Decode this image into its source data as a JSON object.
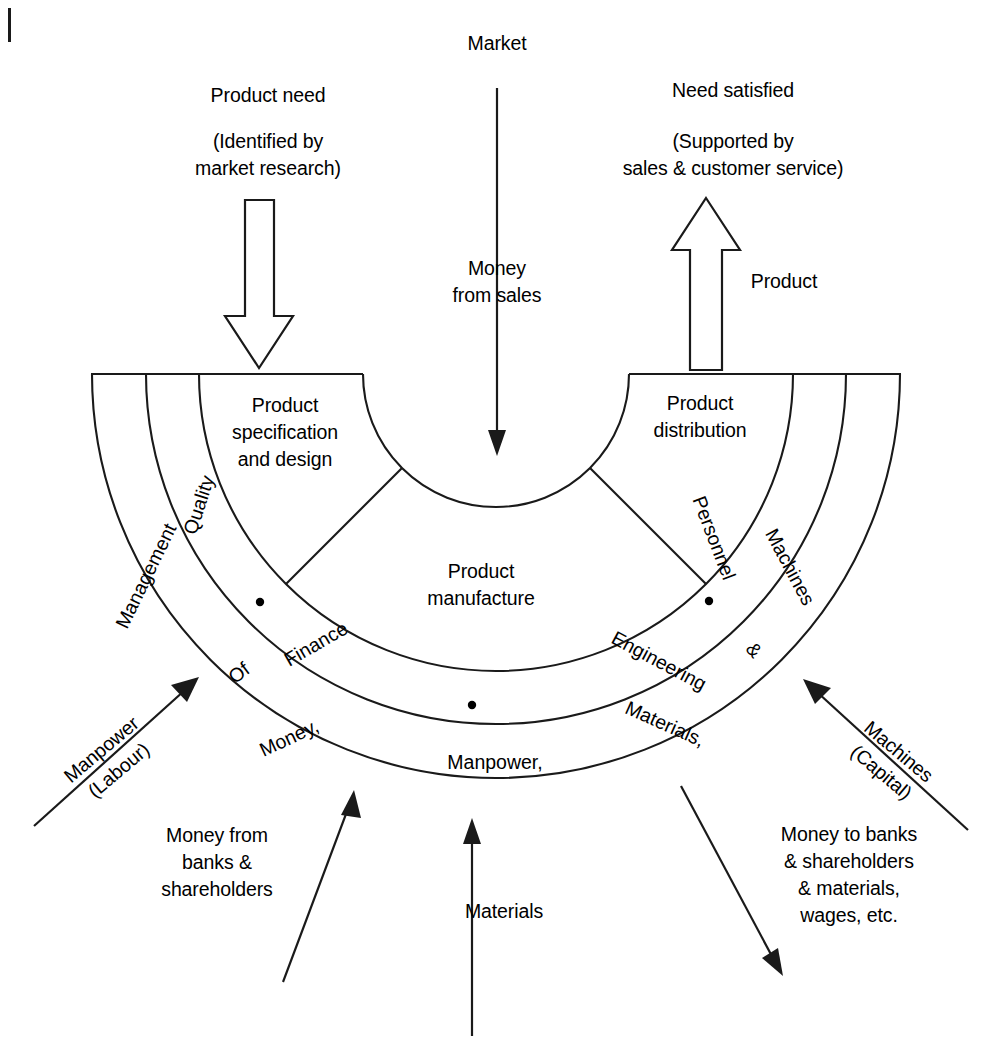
{
  "diagram": {
    "title_top": "Market",
    "flows": {
      "product_need": "Product need",
      "product_need_sub": "(Identified by\nmarket research)",
      "need_satisfied": "Need satisfied",
      "need_satisfied_sub": "(Supported by\nsales & customer service)",
      "money_from_sales": "Money\nfrom sales",
      "product_out": "Product",
      "manpower_labour": "Manpower\n(Labour)",
      "machines_capital": "Machines\n(Capital)",
      "money_from_banks": "Money from\nbanks &\nshareholders",
      "materials_in": "Materials",
      "money_to_banks": "Money to banks\n& shareholders\n& materials,\nwages, etc."
    },
    "hub": {
      "label": "Product\nmanufacture"
    },
    "inner_ring": [
      {
        "id": "product-specification-and-design",
        "label": "Product\nspecification\nand design"
      },
      {
        "id": "finance",
        "label": "Finance"
      },
      {
        "id": "engineering",
        "label": "Engineering"
      },
      {
        "id": "product-distribution",
        "label": "Product\ndistribution"
      }
    ],
    "middle_ring": [
      {
        "id": "quality",
        "label": "Quality"
      },
      {
        "id": "of",
        "label": "Of"
      },
      {
        "id": "money",
        "label": "Money,"
      },
      {
        "id": "manpower",
        "label": "Manpower,"
      },
      {
        "id": "materials",
        "label": "Materials,"
      },
      {
        "id": "ampersand",
        "label": "&"
      },
      {
        "id": "personnel",
        "label": "Personnel"
      }
    ],
    "outer_ring": [
      {
        "id": "management",
        "label": "Management"
      },
      {
        "id": "machines",
        "label": "Machines"
      }
    ],
    "colors": {
      "ink": "#1a1a1a",
      "paper": "#ffffff"
    }
  }
}
